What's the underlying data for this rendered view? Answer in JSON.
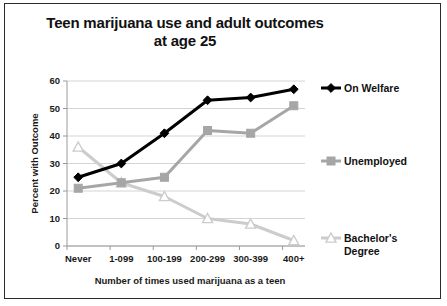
{
  "chart_data": {
    "type": "line",
    "title": "Teen marijuana use and adult outcomes at age 25",
    "title_line1": "Teen marijuana use and adult outcomes",
    "title_line2": "at age 25",
    "xlabel": "Number of times used marijuana as a teen",
    "ylabel": "Percent with Outcome",
    "categories": [
      "Never",
      "1-099",
      "100-199",
      "200-299",
      "300-399",
      "400+"
    ],
    "ylim": [
      0,
      60
    ],
    "yticks": [
      0,
      10,
      20,
      30,
      40,
      50,
      60
    ],
    "grid": true,
    "legend_position": "right",
    "series": [
      {
        "name": "On Welfare",
        "values": [
          25,
          30,
          41,
          53,
          54,
          57
        ],
        "color": "#000000",
        "marker": "diamond-filled"
      },
      {
        "name": "Unemployed",
        "values": [
          21,
          23,
          25,
          42,
          41,
          51
        ],
        "color": "#a6a6a6",
        "marker": "square-filled"
      },
      {
        "name": "Bachelor's Degree",
        "values": [
          36,
          23,
          18,
          10,
          8,
          2
        ],
        "color": "#cccccc",
        "marker": "triangle-open"
      }
    ]
  },
  "legend": {
    "entries": [
      {
        "label": "On Welfare"
      },
      {
        "label": "Unemployed"
      },
      {
        "label": "Bachelor's"
      },
      {
        "label": "Degree"
      }
    ]
  }
}
